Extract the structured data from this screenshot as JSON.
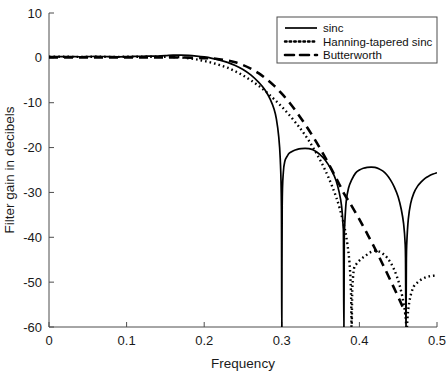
{
  "chart_data": {
    "type": "line",
    "title": "",
    "xlabel": "Frequency",
    "ylabel": "Filter gain in decibels",
    "xlim": [
      0,
      0.5
    ],
    "ylim": [
      -60,
      10
    ],
    "xticks": [
      0,
      0.1,
      0.2,
      0.3,
      0.4,
      0.5
    ],
    "xtick_labels": [
      "0",
      "0.1",
      "0.2",
      "0.3",
      "0.4",
      "0.5"
    ],
    "yticks": [
      10,
      0,
      -10,
      -20,
      -30,
      -40,
      -50,
      -60
    ],
    "ytick_labels": [
      "10",
      "0",
      "-10",
      "-20",
      "-30",
      "-40",
      "-50",
      "-60"
    ],
    "grid": false,
    "legend_position": "upper right",
    "series": [
      {
        "name": "sinc",
        "style": "solid",
        "color": "#000000",
        "x": [
          0,
          0.01,
          0.02,
          0.03,
          0.04,
          0.05,
          0.06,
          0.07,
          0.08,
          0.09,
          0.1,
          0.11,
          0.12,
          0.13,
          0.14,
          0.15,
          0.16,
          0.17,
          0.18,
          0.19,
          0.2,
          0.21,
          0.22,
          0.23,
          0.24,
          0.25,
          0.26,
          0.27,
          0.275,
          0.28,
          0.285,
          0.29,
          0.293,
          0.296,
          0.298,
          0.2995,
          0.3,
          0.3005,
          0.302,
          0.304,
          0.307,
          0.31,
          0.315,
          0.32,
          0.325,
          0.33,
          0.335,
          0.34,
          0.345,
          0.35,
          0.355,
          0.36,
          0.365,
          0.37,
          0.374,
          0.377,
          0.379,
          0.3795,
          0.38,
          0.3805,
          0.381,
          0.383,
          0.386,
          0.39,
          0.395,
          0.4,
          0.405,
          0.41,
          0.415,
          0.42,
          0.425,
          0.43,
          0.435,
          0.44,
          0.445,
          0.45,
          0.454,
          0.457,
          0.459,
          0.4595,
          0.46,
          0.4605,
          0.461,
          0.463,
          0.466,
          0.47,
          0.475,
          0.48,
          0.485,
          0.49,
          0.495,
          0.5
        ],
        "y": [
          0.3,
          0.3,
          0.28,
          0.26,
          0.25,
          0.28,
          0.32,
          0.3,
          0.26,
          0.24,
          0.27,
          0.32,
          0.36,
          0.38,
          0.4,
          0.48,
          0.6,
          0.62,
          0.55,
          0.4,
          0.2,
          -0.1,
          -0.5,
          -1.0,
          -1.7,
          -2.6,
          -3.8,
          -5.4,
          -6.4,
          -7.6,
          -9.2,
          -11.4,
          -13.6,
          -17.5,
          -22.5,
          -33.0,
          -62.0,
          -33.0,
          -25.5,
          -23.0,
          -21.9,
          -21.2,
          -20.7,
          -20.4,
          -20.25,
          -20.2,
          -20.25,
          -20.5,
          -21.0,
          -21.7,
          -22.6,
          -23.8,
          -25.3,
          -27.4,
          -30.0,
          -33.0,
          -37.5,
          -41.0,
          -62.0,
          -41.0,
          -37.5,
          -32.0,
          -29.0,
          -27.2,
          -25.7,
          -25.0,
          -24.6,
          -24.4,
          -24.35,
          -24.4,
          -24.7,
          -25.2,
          -26.0,
          -27.2,
          -28.8,
          -31.0,
          -33.8,
          -37.0,
          -41.5,
          -46.0,
          -62.0,
          -46.0,
          -41.5,
          -36.0,
          -32.5,
          -30.2,
          -28.6,
          -27.6,
          -26.8,
          -26.3,
          -25.9,
          -25.6
        ]
      },
      {
        "name": "Hanning-tapered sinc",
        "style": "dotted",
        "color": "#000000",
        "x": [
          0,
          0.02,
          0.04,
          0.06,
          0.08,
          0.1,
          0.12,
          0.14,
          0.16,
          0.17,
          0.18,
          0.19,
          0.2,
          0.21,
          0.22,
          0.23,
          0.24,
          0.25,
          0.26,
          0.27,
          0.28,
          0.29,
          0.3,
          0.31,
          0.32,
          0.325,
          0.33,
          0.335,
          0.34,
          0.345,
          0.35,
          0.355,
          0.36,
          0.365,
          0.37,
          0.375,
          0.38,
          0.383,
          0.386,
          0.388,
          0.389,
          0.3895,
          0.39,
          0.3905,
          0.391,
          0.393,
          0.396,
          0.4,
          0.404,
          0.408,
          0.412,
          0.416,
          0.42,
          0.424,
          0.428,
          0.432,
          0.436,
          0.44,
          0.444,
          0.448,
          0.452,
          0.456,
          0.459,
          0.4605,
          0.461,
          0.4615,
          0.463,
          0.466,
          0.47,
          0.474,
          0.478,
          0.482,
          0.486,
          0.49,
          0.494,
          0.5
        ],
        "y": [
          0.25,
          0.24,
          0.22,
          0.25,
          0.22,
          0.24,
          0.26,
          0.25,
          0.2,
          0.1,
          -0.1,
          -0.35,
          -0.7,
          -1.1,
          -1.6,
          -2.2,
          -3.0,
          -3.9,
          -5.0,
          -6.2,
          -7.6,
          -9.2,
          -10.9,
          -12.8,
          -14.9,
          -16.0,
          -17.2,
          -18.5,
          -19.9,
          -21.4,
          -23.0,
          -24.7,
          -26.6,
          -28.7,
          -31.0,
          -33.8,
          -37.2,
          -39.8,
          -43.5,
          -47.5,
          -51.5,
          -55.0,
          -62.0,
          -55.0,
          -51.0,
          -47.0,
          -46.0,
          -45.2,
          -44.6,
          -44.1,
          -43.6,
          -43.2,
          -43.0,
          -43.1,
          -43.4,
          -43.9,
          -44.6,
          -45.6,
          -46.9,
          -48.6,
          -50.8,
          -53.8,
          -57.0,
          -60.0,
          -62.0,
          -59.5,
          -56.0,
          -53.0,
          -51.0,
          -50.2,
          -49.6,
          -49.2,
          -48.9,
          -48.7,
          -48.6,
          -48.5
        ]
      },
      {
        "name": "Butterworth",
        "style": "dashed",
        "color": "#000000",
        "x": [
          0,
          0.02,
          0.04,
          0.06,
          0.08,
          0.1,
          0.12,
          0.14,
          0.16,
          0.18,
          0.2,
          0.215,
          0.23,
          0.24,
          0.25,
          0.26,
          0.27,
          0.28,
          0.29,
          0.3,
          0.31,
          0.32,
          0.33,
          0.34,
          0.35,
          0.36,
          0.37,
          0.375,
          0.38,
          0.385,
          0.39,
          0.4,
          0.41,
          0.42,
          0.43,
          0.44,
          0.45,
          0.455,
          0.46
        ],
        "y": [
          0.1,
          0.1,
          0.1,
          0.1,
          0.1,
          0.1,
          0.1,
          0.1,
          0.1,
          0.05,
          -0.05,
          -0.2,
          -0.6,
          -1.0,
          -1.6,
          -2.4,
          -3.4,
          -4.7,
          -6.2,
          -8.0,
          -10.0,
          -12.3,
          -14.8,
          -17.5,
          -20.4,
          -23.5,
          -26.8,
          -28.5,
          -30.2,
          -31.6,
          -33.0,
          -36.0,
          -39.2,
          -42.5,
          -46.0,
          -49.6,
          -53.3,
          -55.2,
          -57.2
        ]
      }
    ],
    "annotations": []
  },
  "legend": {
    "entries": [
      {
        "label": "sinc",
        "style": "solid"
      },
      {
        "label": "Hanning-tapered sinc",
        "style": "dotted"
      },
      {
        "label": "Butterworth",
        "style": "dashed"
      }
    ]
  },
  "colors": {
    "curve": "#000000",
    "axis": "#4d4d4d",
    "text": "#1a1a1a",
    "background": "#ffffff"
  }
}
